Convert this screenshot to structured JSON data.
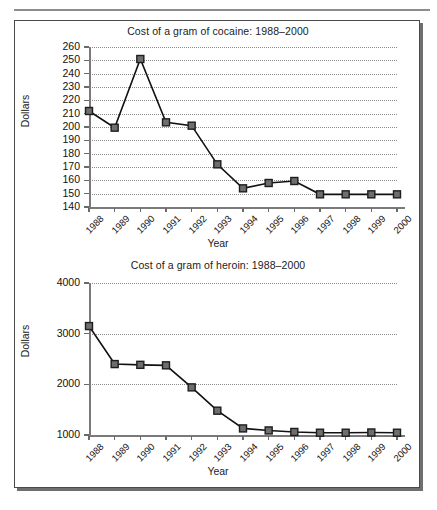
{
  "figure": {
    "background_color": "#ffffff",
    "border_color": "#4a4a4a",
    "rule_color": "#8d8d8d",
    "line_color": "#111111",
    "marker_fill": "#6e6e6e",
    "marker_stroke": "#1d1d1d",
    "grid_color": "#8a8a8a"
  },
  "chart_data": [
    {
      "type": "line",
      "id": "cocaine",
      "title": "Cost of a gram of cocaine: 1988–2000",
      "xlabel": "Year",
      "ylabel": "Dollars",
      "categories": [
        "1988",
        "1989",
        "1990",
        "1991",
        "1992",
        "1993",
        "1994",
        "1995",
        "1996",
        "1997",
        "1998",
        "1999",
        "2000"
      ],
      "values": [
        212,
        199.5,
        251,
        203.5,
        201,
        172,
        154,
        158,
        159.5,
        149.5,
        149.5,
        149.5,
        149.5
      ],
      "ylim": [
        140,
        260
      ],
      "yticks": [
        140,
        150,
        160,
        170,
        180,
        190,
        200,
        210,
        220,
        230,
        240,
        250,
        260
      ],
      "ytick_labels": [
        "140",
        "150",
        "160",
        "170",
        "180",
        "190",
        "200",
        "210",
        "220",
        "230",
        "240",
        "250",
        "260"
      ],
      "grid": true,
      "legend": "none",
      "marker": "square"
    },
    {
      "type": "line",
      "id": "heroin",
      "title": "Cost of a gram of heroin: 1988–2000",
      "xlabel": "Year",
      "ylabel": "Dollars",
      "categories": [
        "1988",
        "1989",
        "1990",
        "1991",
        "1992",
        "1993",
        "1994",
        "1995",
        "1996",
        "1997",
        "1998",
        "1999",
        "2000"
      ],
      "values": [
        3150,
        2400,
        2385,
        2375,
        1940,
        1480,
        1130,
        1090,
        1060,
        1045,
        1045,
        1050,
        1045
      ],
      "ylim": [
        1000,
        4000
      ],
      "yticks": [
        1000,
        2000,
        3000,
        4000
      ],
      "ytick_labels": [
        "1000",
        "2000",
        "3000",
        "4000"
      ],
      "grid": true,
      "legend": "none",
      "marker": "square"
    }
  ]
}
